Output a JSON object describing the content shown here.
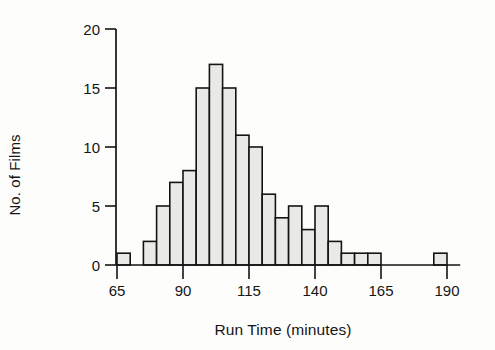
{
  "chart_data": {
    "type": "bar",
    "title": "",
    "xlabel": "Run Time (minutes)",
    "ylabel": "No. of Films",
    "xlim": [
      65,
      195
    ],
    "ylim": [
      0,
      20
    ],
    "bin_width": 5,
    "grid": false,
    "legend": null,
    "xticks": [
      65,
      90,
      115,
      140,
      165,
      190
    ],
    "xtick_labels": [
      "65",
      "90",
      "115",
      "140",
      "165",
      "190"
    ],
    "yticks": [
      0,
      5,
      10,
      15,
      20
    ],
    "ytick_labels": [
      "0",
      "5",
      "10",
      "15",
      "20"
    ],
    "bin_starts": [
      65,
      70,
      75,
      80,
      85,
      90,
      95,
      100,
      105,
      110,
      115,
      120,
      125,
      130,
      135,
      140,
      145,
      150,
      155,
      160,
      165,
      170,
      175,
      180,
      185
    ],
    "values": [
      1,
      0,
      2,
      5,
      7,
      8,
      15,
      17,
      15,
      11,
      10,
      6,
      4,
      5,
      3,
      5,
      2,
      1,
      1,
      1,
      0,
      0,
      0,
      0,
      1
    ],
    "categories": [
      "65-70",
      "70-75",
      "75-80",
      "80-85",
      "85-90",
      "90-95",
      "95-100",
      "100-105",
      "105-110",
      "110-115",
      "115-120",
      "120-125",
      "125-130",
      "130-135",
      "135-140",
      "140-145",
      "145-150",
      "150-155",
      "155-160",
      "160-165",
      "165-170",
      "170-175",
      "175-180",
      "180-185",
      "185-190"
    ],
    "bar_fill": "#e9e9e7",
    "bar_stroke": "#141414",
    "background": "#fdfdfc"
  }
}
